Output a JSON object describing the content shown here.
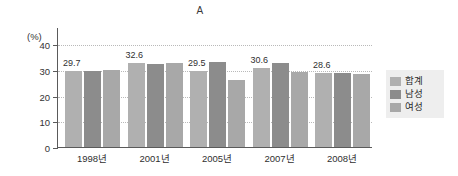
{
  "chart_data": {
    "type": "bar",
    "title": "A",
    "xlabel": "",
    "ylabel": "(%)",
    "ylim": [
      0,
      40
    ],
    "yticks": [
      0,
      10,
      20,
      30,
      40
    ],
    "grid": true,
    "legend_position": "right",
    "categories": [
      "1998년",
      "2001년",
      "2005년",
      "2007년",
      "2008년"
    ],
    "series": [
      {
        "name": "합계",
        "color": "#b0b0b0",
        "values": [
          29.7,
          32.6,
          29.5,
          30.6,
          28.6
        ],
        "labels": [
          "29.7",
          "32.6",
          "29.5",
          "30.6",
          "28.6"
        ]
      },
      {
        "name": "남성",
        "color": "#8c8c8c",
        "values": [
          29.4,
          32.2,
          33.0,
          32.5,
          28.8
        ],
        "labels": [
          "",
          "",
          "",
          "",
          ""
        ]
      },
      {
        "name": "여성",
        "color": "#a8a8a8",
        "values": [
          30.0,
          32.7,
          26.1,
          29.0,
          28.3
        ],
        "labels": [
          "",
          "",
          "",
          "",
          ""
        ]
      }
    ]
  },
  "legend": {
    "items": [
      {
        "label": "합계",
        "color": "#b0b0b0"
      },
      {
        "label": "남성",
        "color": "#8c8c8c"
      },
      {
        "label": "여성",
        "color": "#a8a8a8"
      }
    ]
  }
}
